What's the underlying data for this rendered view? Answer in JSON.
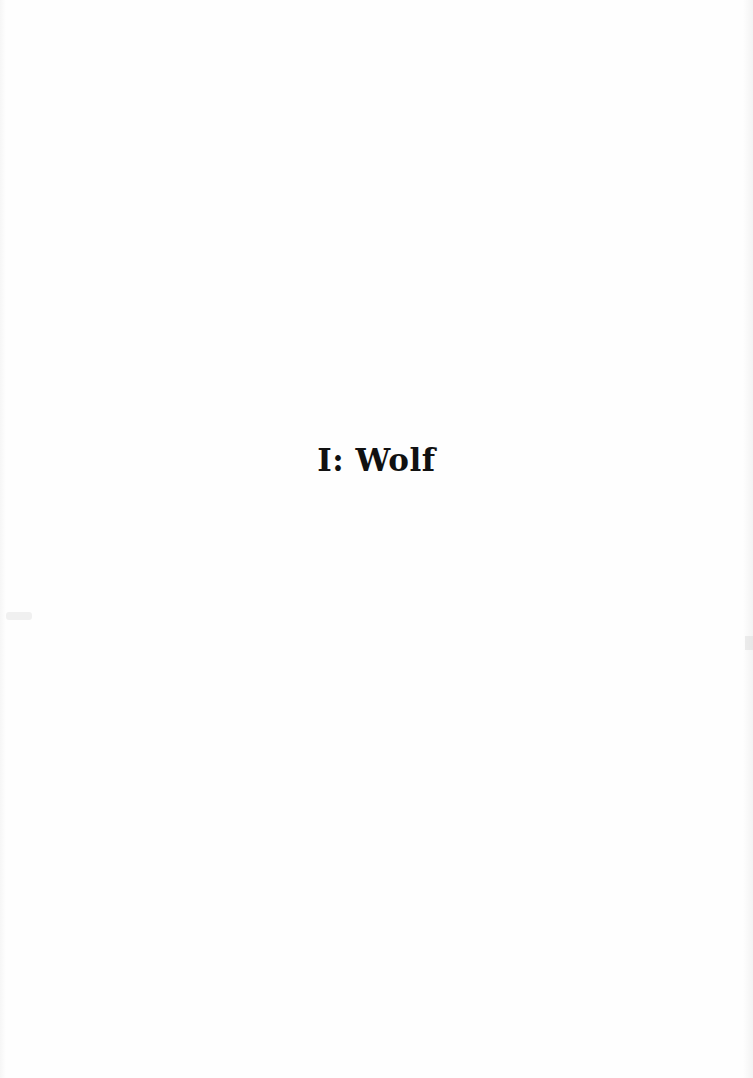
{
  "page": {
    "chapter_title": "I: Wolf",
    "background_color": "#fefefe",
    "text_color": "#111111"
  }
}
